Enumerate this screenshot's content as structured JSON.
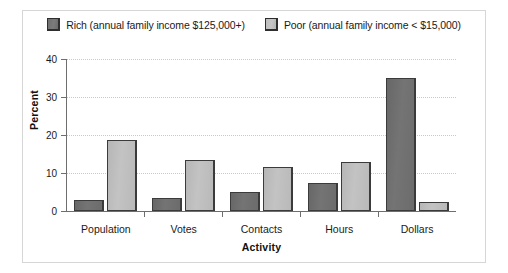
{
  "chart_data": {
    "type": "bar",
    "title": "",
    "xlabel": "Activity",
    "ylabel": "Percent",
    "categories": [
      "Population",
      "Votes",
      "Contacts",
      "Hours",
      "Dollars"
    ],
    "series": [
      {
        "name": "Rich (annual family income $125,000+)",
        "color": "#707070",
        "values": [
          3.0,
          3.5,
          5.0,
          7.5,
          35.0
        ]
      },
      {
        "name": "Poor (annual family income < $15,000)",
        "color": "#bdbdbd",
        "values": [
          18.8,
          13.5,
          11.5,
          13.0,
          2.5
        ]
      }
    ],
    "ylim": [
      0,
      40
    ],
    "yticks": [
      0,
      10,
      20,
      30,
      40
    ],
    "ytick_labels": [
      "0",
      "10",
      "20",
      "30",
      "40"
    ],
    "grid": true,
    "legend_position": "top-center"
  },
  "legend": {
    "entries": [
      {
        "label": "Rich (annual family income $125,000+)",
        "swatch": "rich"
      },
      {
        "label": "Poor (annual family income < $15,000)",
        "swatch": "poor"
      }
    ]
  }
}
